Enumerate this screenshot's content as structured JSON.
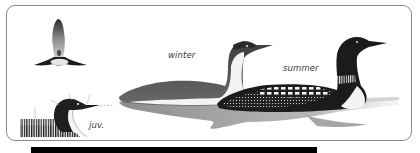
{
  "illustration": {
    "subject": "loon plumages",
    "labels": {
      "winter": "winter",
      "summer": "summer",
      "juvenile": "juv."
    },
    "figures": [
      {
        "name": "flying-loon",
        "pose": "flight, wings spread, viewed from below"
      },
      {
        "name": "juvenile-loon-head",
        "pose": "head and back detail with pointer lines"
      },
      {
        "name": "winter-loon",
        "pose": "swimming, facing right"
      },
      {
        "name": "summer-loon",
        "pose": "swimming, facing right, checkered back"
      }
    ]
  },
  "colors": {
    "frame_border": "#8a8a8a",
    "ink_dark": "#1a1a1a",
    "plumage_gray": "#6d6d6d",
    "water_gray": "#9a9a9a",
    "bottom_bar": "#000000"
  }
}
